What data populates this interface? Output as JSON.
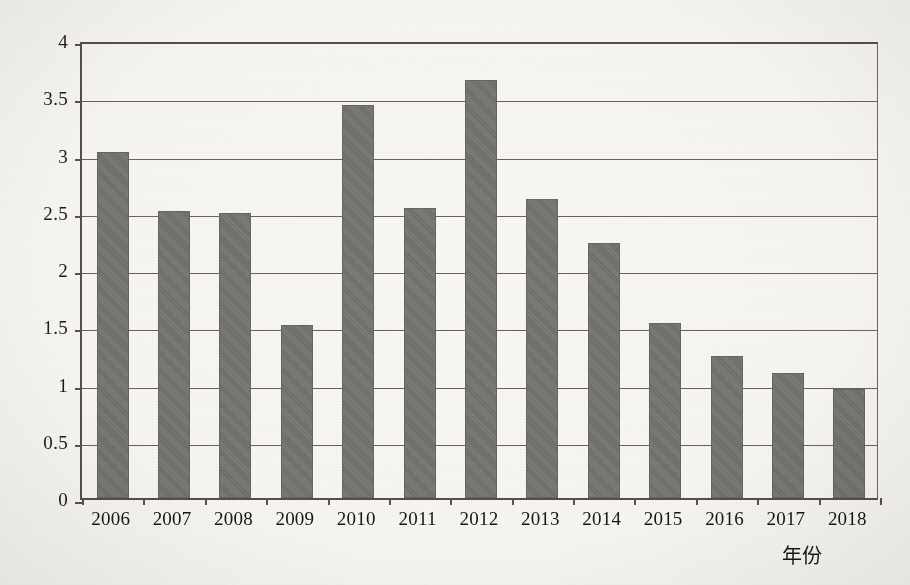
{
  "chart_data": {
    "type": "bar",
    "title": "",
    "xlabel": "年份",
    "ylabel": "",
    "categories": [
      "2006",
      "2007",
      "2008",
      "2009",
      "2010",
      "2011",
      "2012",
      "2013",
      "2014",
      "2015",
      "2016",
      "2017",
      "2018"
    ],
    "values": [
      3.02,
      2.51,
      2.49,
      1.51,
      3.43,
      2.53,
      3.65,
      2.61,
      2.23,
      1.53,
      1.24,
      1.09,
      0.95
    ],
    "series": [
      {
        "name": "",
        "values": [
          3.02,
          2.51,
          2.49,
          1.51,
          3.43,
          2.53,
          3.65,
          2.61,
          2.23,
          1.53,
          1.24,
          1.09,
          0.95
        ]
      }
    ],
    "ylim": [
      0,
      4
    ],
    "ytick_values": [
      0,
      0.5,
      1,
      1.5,
      2,
      2.5,
      3,
      3.5,
      4
    ],
    "ytick_labels": [
      "0",
      "0.5",
      "1",
      "1.5",
      "2",
      "2.5",
      "3",
      "3.5",
      "4"
    ],
    "grid": true,
    "grid_axis": "y",
    "legend": false,
    "legend_position": "none",
    "bar_color": "#71706d",
    "axis_color": "#585249",
    "background_color": "#f7f6f3"
  }
}
